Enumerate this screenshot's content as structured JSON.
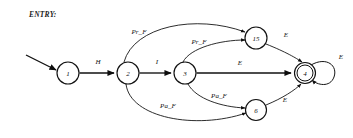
{
  "diagram": {
    "caption": "ENTRY:",
    "type": "state-machine",
    "colors": {
      "stroke": "#111111",
      "background": "#ffffff",
      "text": "#121212"
    },
    "start_marker": "incoming-arrow",
    "nodes": [
      {
        "id": "n1",
        "label": "1",
        "cx": 68,
        "cy": 73,
        "r": 11,
        "accepting": false
      },
      {
        "id": "n2",
        "label": "2",
        "cx": 128,
        "cy": 73,
        "r": 11,
        "accepting": false
      },
      {
        "id": "n3",
        "label": "3",
        "cx": 185,
        "cy": 73,
        "r": 11,
        "accepting": false
      },
      {
        "id": "n15",
        "label": "15",
        "cx": 256,
        "cy": 38,
        "r": 11,
        "accepting": false
      },
      {
        "id": "n6",
        "label": "6",
        "cx": 256,
        "cy": 110,
        "r": 10.5,
        "accepting": false
      },
      {
        "id": "n4",
        "label": "4",
        "cx": 305,
        "cy": 73,
        "r": 10.5,
        "accepting": true
      }
    ],
    "edges": [
      {
        "from": "n1",
        "to": "n2",
        "label": "H",
        "label_x": 98,
        "label_y": 62,
        "shape": "straight"
      },
      {
        "from": "n2",
        "to": "n3",
        "label": "I",
        "label_x": 157,
        "label_y": 62,
        "shape": "straight"
      },
      {
        "from": "n2",
        "to": "n15",
        "label": "Pr_F",
        "label_x": 139,
        "label_y": 32,
        "shape": "curve-up"
      },
      {
        "from": "n3",
        "to": "n15",
        "label": "Pr_F",
        "label_x": 199,
        "label_y": 42,
        "shape": "curve-up"
      },
      {
        "from": "n3",
        "to": "n4",
        "label": "E",
        "label_x": 240,
        "label_y": 63,
        "shape": "straight"
      },
      {
        "from": "n2",
        "to": "n6",
        "label": "Pa_F",
        "label_x": 168,
        "label_y": 106,
        "shape": "curve-down"
      },
      {
        "from": "n3",
        "to": "n6",
        "label": "Pa_F",
        "label_x": 219,
        "label_y": 96,
        "shape": "curve-down"
      },
      {
        "from": "n15",
        "to": "n4",
        "label": "E",
        "label_x": 286,
        "label_y": 35,
        "shape": "curve-down"
      },
      {
        "from": "n6",
        "to": "n4",
        "label": "E",
        "label_x": 285,
        "label_y": 100,
        "shape": "curve-up"
      },
      {
        "from": "n4",
        "to": "n4",
        "label": "E",
        "label_x": 341,
        "label_y": 57,
        "shape": "self-loop"
      }
    ]
  }
}
